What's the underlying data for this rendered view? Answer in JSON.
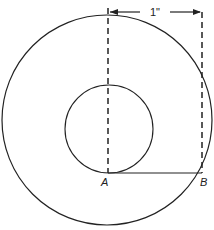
{
  "diagram": {
    "labels": {
      "point_a": "A",
      "point_b": "B",
      "dimension": "1\""
    },
    "colors": {
      "stroke": "#222222",
      "background": "#ffffff"
    }
  }
}
